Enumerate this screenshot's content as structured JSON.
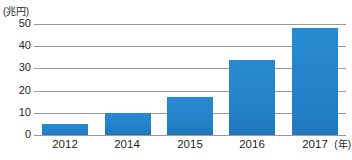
{
  "chart_data": {
    "type": "bar",
    "title": "",
    "subtitle": "",
    "xlabel": "(年)",
    "ylabel": "(兆円)",
    "categories": [
      "2012",
      "2014",
      "2015",
      "2016",
      "2017"
    ],
    "values": [
      5,
      10,
      17,
      34,
      48
    ],
    "series": [
      {
        "name": "",
        "values": [
          5,
          10,
          17,
          34,
          48
        ]
      }
    ],
    "ylim": [
      0,
      50
    ],
    "y_ticks": [
      0,
      10,
      20,
      30,
      40,
      50
    ],
    "y_tick_labels": [
      "0",
      "10",
      "20",
      "30",
      "40",
      "50"
    ],
    "x_tick_labels": [
      "2012",
      "2014",
      "2015",
      "2016",
      "2017"
    ],
    "grid": "horizontal",
    "legend": "none",
    "bar_color": "#2382c8",
    "gridline_color": "#9a9a9a",
    "text_color": "#231f20",
    "background_color": "#ffffff",
    "annotations": []
  },
  "axes": {
    "y_unit": "(兆円)",
    "x_unit": "(年)"
  }
}
